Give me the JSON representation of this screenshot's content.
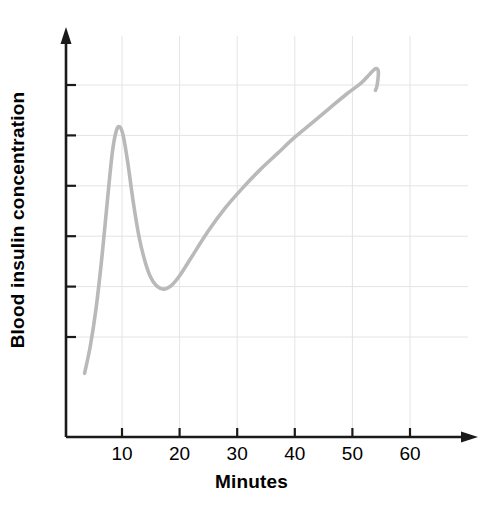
{
  "chart_data": {
    "type": "line",
    "title": "",
    "xlabel": "Minutes",
    "ylabel": "Blood insulin concentration",
    "xlim": [
      0,
      70
    ],
    "ylim": [
      0,
      10
    ],
    "grid": true,
    "legend": "none",
    "x_ticks": [
      {
        "value": 10,
        "label": "10"
      },
      {
        "value": 20,
        "label": "20"
      },
      {
        "value": 30,
        "label": "30"
      },
      {
        "value": 40,
        "label": "40"
      },
      {
        "value": 50,
        "label": "50"
      },
      {
        "value": 60,
        "label": "60"
      }
    ],
    "y_ticks": [
      {
        "value": 9.0,
        "label": ""
      },
      {
        "value": 7.6,
        "label": ""
      },
      {
        "value": 6.2,
        "label": ""
      },
      {
        "value": 4.8,
        "label": ""
      },
      {
        "value": 3.4,
        "label": ""
      },
      {
        "value": 2.0,
        "label": ""
      }
    ],
    "series": [
      {
        "name": "Blood insulin concentration",
        "color": "#b9b9b9",
        "line_width": 3.6,
        "x": [
          3.5,
          4.5,
          5.5,
          6.5,
          7.5,
          8.3,
          9.0,
          9.6,
          10.2,
          11.0,
          12.0,
          13.0,
          14.0,
          15.0,
          16.0,
          17.2,
          18.5,
          20.0,
          22.0,
          25.0,
          28.0,
          31.0,
          34.0,
          37.0,
          40.0,
          43.0,
          46.0,
          49.0,
          51.5,
          53.0,
          54.0,
          54.5,
          54.3,
          54.0
        ],
        "y": [
          0.99,
          1.75,
          2.8,
          4.2,
          5.85,
          7.1,
          7.72,
          7.84,
          7.6,
          6.85,
          5.7,
          4.75,
          4.1,
          3.65,
          3.42,
          3.33,
          3.42,
          3.7,
          4.2,
          4.95,
          5.6,
          6.15,
          6.65,
          7.1,
          7.55,
          7.95,
          8.35,
          8.75,
          9.05,
          9.3,
          9.45,
          9.38,
          9.0,
          8.85
        ]
      }
    ],
    "annotations": {
      "initial_peak_minute": 10,
      "trough_minute": 17,
      "final_peak_minute": 54
    }
  },
  "axes": {
    "x_axis_name": "minutes-axis",
    "y_axis_name": "blood-insulin-axis",
    "arrow_heads": true,
    "axis_color": "#1a1a1a",
    "grid_color": "#e4e4e4"
  }
}
